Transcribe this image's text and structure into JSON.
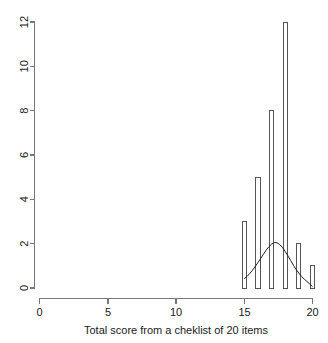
{
  "chart_data": {
    "type": "bar",
    "title": "",
    "subtitle": "",
    "xlabel": "Total score from a cheklist of 20 items",
    "ylabel": "",
    "categories": [
      "15",
      "16",
      "17",
      "18",
      "19",
      "20"
    ],
    "values": [
      3,
      5,
      8,
      12,
      2,
      1
    ],
    "x": [
      15,
      16,
      17,
      18,
      19,
      20
    ],
    "xlim": [
      0,
      20
    ],
    "ylim": [
      0,
      12
    ],
    "xticks": [
      0,
      5,
      10,
      15,
      20
    ],
    "xtick_labels": [
      "0",
      "5",
      "10",
      "15",
      "20"
    ],
    "yticks": [
      0,
      2,
      4,
      6,
      8,
      10,
      12
    ],
    "ytick_labels": [
      "0",
      "2",
      "4",
      "6",
      "8",
      "10",
      "12"
    ],
    "grid": false,
    "legend": null,
    "legend_position": "none",
    "series": [
      {
        "name": "frequency",
        "type": "bar",
        "values": [
          3,
          5,
          8,
          12,
          2,
          1
        ]
      },
      {
        "name": "density-curve",
        "type": "line",
        "description": "normal density overlay",
        "peak_x": 17.2,
        "peak_y": 2.05,
        "points": [
          [
            15.0,
            0.42
          ],
          [
            15.2,
            0.52
          ],
          [
            15.4,
            0.65
          ],
          [
            15.6,
            0.8
          ],
          [
            15.8,
            0.97
          ],
          [
            16.0,
            1.14
          ],
          [
            16.2,
            1.33
          ],
          [
            16.4,
            1.52
          ],
          [
            16.6,
            1.7
          ],
          [
            16.8,
            1.86
          ],
          [
            17.0,
            1.98
          ],
          [
            17.2,
            2.05
          ],
          [
            17.4,
            2.04
          ],
          [
            17.6,
            1.96
          ],
          [
            17.8,
            1.83
          ],
          [
            18.0,
            1.65
          ],
          [
            18.2,
            1.45
          ],
          [
            18.4,
            1.24
          ],
          [
            18.6,
            1.03
          ],
          [
            18.8,
            0.84
          ],
          [
            19.0,
            0.67
          ],
          [
            19.2,
            0.52
          ],
          [
            19.4,
            0.4
          ],
          [
            19.6,
            0.29
          ],
          [
            19.8,
            0.18
          ],
          [
            20.0,
            0.06
          ]
        ]
      }
    ]
  },
  "axes": {
    "x_axis_name": "x-axis",
    "y_axis_name": "y-axis"
  },
  "labels": {
    "y_0": "0",
    "y_2": "2",
    "y_4": "4",
    "y_6": "6",
    "y_8": "8",
    "y_10": "10",
    "y_12": "12",
    "x_0": "0",
    "x_5": "5",
    "x_10": "10",
    "x_15": "15",
    "x_20": "20",
    "x_axis_title": "Total score from a cheklist of 20 items"
  },
  "colors": {
    "background": "#ffffff",
    "axis": "#777777",
    "bar_stroke": "#555555",
    "curve": "#1c1c1c",
    "text": "#1a1a1a"
  }
}
